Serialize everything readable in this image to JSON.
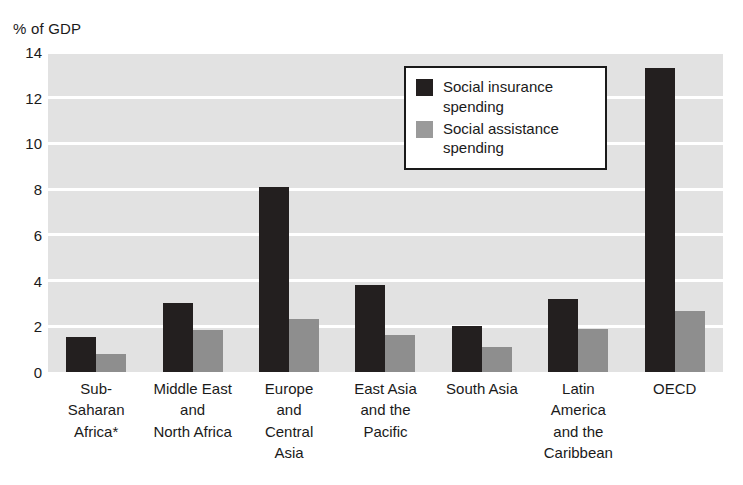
{
  "chart_data": {
    "type": "bar",
    "title": "",
    "subtitle": "",
    "xlabel": "",
    "ylabel": "% of GDP",
    "ylim": [
      0,
      14
    ],
    "ytick_values": [
      0,
      2,
      4,
      6,
      8,
      10,
      12,
      14
    ],
    "ytick_labels": [
      "0",
      "2",
      "4",
      "6",
      "8",
      "10",
      "12",
      "14"
    ],
    "grid": true,
    "grid_axis": "y",
    "legend_position": "upper-center",
    "categories": [
      "Sub-\nSaharan\nAfrica*",
      "Middle East\nand\nNorth Africa",
      "Europe\nand\nCentral\nAsia",
      "East Asia\nand the\nPacific",
      "South Asia",
      "Latin\nAmerica\nand the\nCaribbean",
      "OECD"
    ],
    "series": [
      {
        "name": "Social insurance\nspending",
        "color": "#231f1f",
        "values": [
          1.55,
          3.0,
          8.1,
          3.8,
          2.0,
          3.2,
          13.3
        ]
      },
      {
        "name": "Social assistance\nspending",
        "color": "#8e8e8e",
        "values": [
          0.8,
          1.85,
          2.3,
          1.6,
          1.1,
          1.9,
          2.65
        ]
      }
    ],
    "annotations": [
      "* Africa label carries an asterisk footnote marker"
    ],
    "plot_background": "#e2e2e2",
    "gridline_color": "#ffffff",
    "page_background": "#ffffff"
  }
}
